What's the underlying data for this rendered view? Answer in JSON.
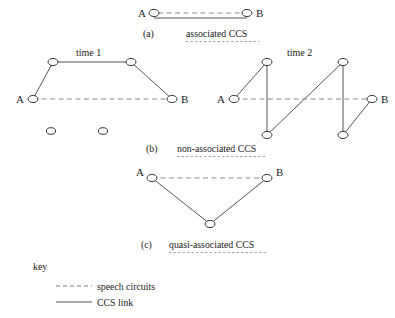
{
  "figure": {
    "background_color": "#ffffff",
    "node_stroke_color": "#3a3a3a",
    "ccs_link_color": "#555555",
    "speech_circuit_color": "#8a8a8a"
  },
  "panels": [
    {
      "id": "a",
      "caption_label": "(a)",
      "caption_text": "associated CCS",
      "endpoint_left_label": "A",
      "endpoint_right_label": "B"
    },
    {
      "id": "b",
      "caption_label": "(b)",
      "caption_text": "non-associated CCS",
      "endpoint_left_label": "A",
      "endpoint_right_label": "B",
      "time_panels": [
        {
          "label": "time  1"
        },
        {
          "label": "time  2"
        }
      ],
      "time1_endpoint_left_label": "A",
      "time1_endpoint_right_label": "B",
      "time2_endpoint_left_label": "A",
      "time2_endpoint_right_label": "B"
    },
    {
      "id": "c",
      "caption_label": "(c)",
      "caption_text": "quasi-associated CCS",
      "endpoint_left_label": "A",
      "endpoint_right_label": "B"
    }
  ],
  "key": {
    "title": "key",
    "items": [
      {
        "line_style": "dashed",
        "label": "speech circuits"
      },
      {
        "line_style": "solid",
        "label": "CCS link"
      }
    ]
  }
}
